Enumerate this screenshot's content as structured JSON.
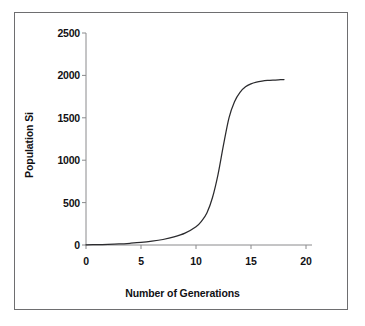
{
  "figure": {
    "background_color": "#ffffff",
    "frame_color": "#6e6e70",
    "axis_color": "#8a8a8c",
    "curve_color": "#2b2b2e",
    "text_color": "#111114"
  },
  "chart_data": {
    "type": "line",
    "title": "",
    "subtitle": "",
    "xlabel": "Number of Generations",
    "ylabel": "Population Si",
    "xlim": [
      0,
      20
    ],
    "ylim": [
      0,
      2500
    ],
    "xticks": [
      0,
      5,
      10,
      15,
      20
    ],
    "xtick_labels": [
      "0",
      "5",
      "10",
      "15",
      "20"
    ],
    "yticks": [
      0,
      500,
      1000,
      1500,
      2000,
      2500
    ],
    "ytick_labels": [
      "0",
      "500",
      "1000",
      "1500",
      "2000",
      "2500"
    ],
    "grid": false,
    "legend": false,
    "legend_position": "none",
    "annotations": [],
    "series": [
      {
        "name": "Population size",
        "x": [
          0,
          1,
          2,
          3,
          4,
          5,
          6,
          7,
          8,
          9,
          10,
          10.5,
          11,
          11.5,
          12,
          12.5,
          13,
          13.5,
          14,
          14.5,
          15,
          15.5,
          16,
          16.5,
          17,
          17.5,
          18
        ],
        "values": [
          2,
          4,
          7,
          12,
          20,
          30,
          45,
          65,
          95,
          140,
          215,
          280,
          380,
          560,
          830,
          1180,
          1500,
          1690,
          1800,
          1865,
          1900,
          1920,
          1932,
          1940,
          1945,
          1948,
          1950
        ]
      }
    ]
  }
}
